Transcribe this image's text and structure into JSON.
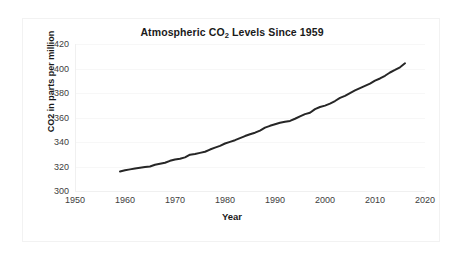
{
  "chart_data": {
    "type": "line",
    "title": "Atmospheric CO2 Levels Since 1959",
    "title_prefix": "Atmospheric CO",
    "title_sub": "2",
    "title_suffix": " Levels Since 1959",
    "xlabel": "Year",
    "ylabel": "CO2 in parts per million",
    "xlim": [
      1950,
      2020
    ],
    "ylim": [
      300,
      420
    ],
    "xticks": [
      1950,
      1960,
      1970,
      1980,
      1990,
      2000,
      2010,
      2020
    ],
    "yticks": [
      300,
      320,
      340,
      360,
      380,
      400,
      420
    ],
    "grid": true,
    "grid_axis": "y",
    "legend": "none",
    "line_color": "#262626",
    "line_width": 2,
    "series": [
      {
        "name": "Atmospheric CO2",
        "x": [
          1959,
          1960,
          1961,
          1962,
          1963,
          1964,
          1965,
          1966,
          1967,
          1968,
          1969,
          1970,
          1971,
          1972,
          1973,
          1974,
          1975,
          1976,
          1977,
          1978,
          1979,
          1980,
          1981,
          1982,
          1983,
          1984,
          1985,
          1986,
          1987,
          1988,
          1989,
          1990,
          1991,
          1992,
          1993,
          1994,
          1995,
          1996,
          1997,
          1998,
          1999,
          2000,
          2001,
          2002,
          2003,
          2004,
          2005,
          2006,
          2007,
          2008,
          2009,
          2010,
          2011,
          2012,
          2013,
          2014,
          2015,
          2016
        ],
        "values": [
          315.98,
          316.91,
          317.64,
          318.45,
          318.99,
          319.62,
          320.04,
          321.37,
          322.18,
          323.05,
          324.62,
          325.68,
          326.32,
          327.46,
          329.68,
          330.19,
          331.12,
          332.03,
          333.84,
          335.41,
          336.84,
          338.76,
          340.12,
          341.48,
          343.15,
          344.85,
          346.35,
          347.61,
          349.31,
          351.69,
          353.2,
          354.45,
          355.7,
          356.54,
          357.21,
          358.96,
          360.97,
          362.74,
          363.88,
          366.84,
          368.54,
          369.71,
          371.32,
          373.45,
          375.98,
          377.7,
          379.98,
          382.09,
          384.02,
          385.83,
          387.64,
          390.1,
          391.85,
          394.06,
          396.74,
          398.81,
          401.01,
          404.22
        ]
      }
    ]
  }
}
